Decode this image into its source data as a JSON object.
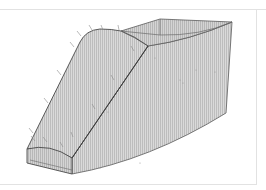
{
  "figure": {
    "fill_color": "#d9d9d9",
    "hatch_color": "#b9b9b9",
    "edge_color": "#555555",
    "frame_color": "#e2e2e2",
    "leader_count": 12
  }
}
